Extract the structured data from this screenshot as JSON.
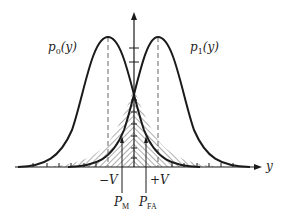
{
  "diagram": {
    "title": "",
    "curves": [
      {
        "id": "p0",
        "label_main": "p",
        "label_sub": "0",
        "label_arg": "(y)",
        "mean": "-V"
      },
      {
        "id": "p1",
        "label_main": "p",
        "label_sub": "1",
        "label_arg": "(y)",
        "mean": "+V"
      }
    ],
    "axis": {
      "x_label": "y"
    },
    "ticks": {
      "minus_v": "−V",
      "plus_v": "+V"
    },
    "regions": {
      "miss": {
        "label_main": "P",
        "label_sub": "M"
      },
      "false_alarm": {
        "label_main": "P",
        "label_sub": "FA"
      }
    },
    "colors": {
      "stroke": "#1a1a1a",
      "dashed": "#555555",
      "hatch": "#333333",
      "background": "#ffffff"
    }
  }
}
